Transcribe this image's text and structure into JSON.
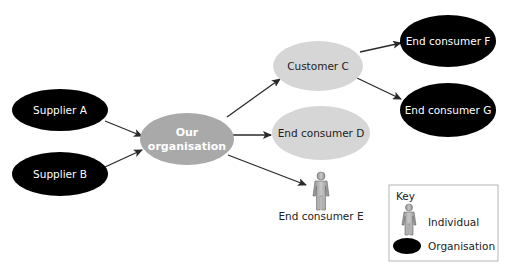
{
  "colors": {
    "organisation_fill": "#000000",
    "our_org_fill": "#a9a9a9",
    "customer_fill": "#d6d6d6",
    "arrow": "#2a2a2a",
    "person_fill": "#b0b0b0",
    "key_border": "#b5b5b5"
  },
  "nodes": {
    "supplier_a": {
      "label": "Supplier A",
      "type": "organisation"
    },
    "supplier_b": {
      "label": "Supplier B",
      "type": "organisation"
    },
    "our_org": {
      "label_line1": "Our",
      "label_line2": "organisation",
      "type": "focal-organisation"
    },
    "customer_c": {
      "label": "Customer C",
      "type": "customer"
    },
    "end_consumer_d": {
      "label": "End consumer D",
      "type": "customer"
    },
    "end_consumer_e": {
      "label": "End consumer E",
      "type": "individual"
    },
    "end_consumer_f": {
      "label": "End consumer F",
      "type": "organisation"
    },
    "end_consumer_g": {
      "label": "End consumer G",
      "type": "organisation"
    }
  },
  "edges": [
    {
      "from": "Supplier A",
      "to": "Our organisation"
    },
    {
      "from": "Supplier B",
      "to": "Our organisation"
    },
    {
      "from": "Our organisation",
      "to": "Customer C"
    },
    {
      "from": "Our organisation",
      "to": "End consumer D"
    },
    {
      "from": "Our organisation",
      "to": "End consumer E"
    },
    {
      "from": "Customer C",
      "to": "End consumer F"
    },
    {
      "from": "Customer C",
      "to": "End consumer G"
    }
  ],
  "key": {
    "title": "Key",
    "items": [
      {
        "icon": "person-icon",
        "label": "Individual"
      },
      {
        "icon": "black-ellipse-icon",
        "label": "Organisation"
      }
    ]
  }
}
